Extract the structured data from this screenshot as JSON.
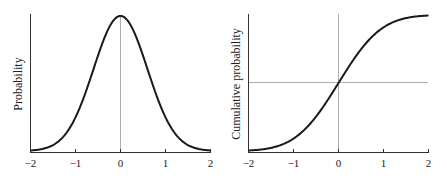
{
  "chart_data": [
    {
      "type": "line",
      "title": "",
      "xlabel": "",
      "ylabel": "Probability",
      "xlim": [
        -2,
        2
      ],
      "x_ticks": [
        "−2",
        "−1",
        "0",
        "1",
        "2"
      ],
      "y_ticks": [],
      "grid": false,
      "reference_lines": [
        {
          "orientation": "vertical",
          "x": 0
        }
      ],
      "series": [
        {
          "name": "Normal PDF",
          "function": "exp(-x^2/(2*0.6^2))",
          "x": [
            -2,
            -1.5,
            -1,
            -0.5,
            0,
            0.5,
            1,
            1.5,
            2
          ],
          "values": [
            0.004,
            0.044,
            0.25,
            0.7,
            1.0,
            0.7,
            0.25,
            0.044,
            0.004
          ]
        }
      ]
    },
    {
      "type": "line",
      "title": "",
      "xlabel": "",
      "ylabel": "Cumulative probability",
      "xlim": [
        -2,
        2
      ],
      "x_ticks": [
        "−2",
        "−1",
        "0",
        "1",
        "2"
      ],
      "y_ticks": [],
      "grid": false,
      "reference_lines": [
        {
          "orientation": "vertical",
          "x": 0
        },
        {
          "orientation": "horizontal",
          "y": 0.5
        }
      ],
      "series": [
        {
          "name": "Normal CDF",
          "x": [
            -2,
            -1.5,
            -1,
            -0.5,
            0,
            0.5,
            1,
            1.5,
            2
          ],
          "values": [
            0.0,
            0.02,
            0.1,
            0.27,
            0.5,
            0.73,
            0.9,
            0.98,
            1.0
          ]
        }
      ]
    }
  ],
  "left": {
    "ylabel": "Probability",
    "ticks": [
      "−2",
      "−1",
      "0",
      "1",
      "2"
    ]
  },
  "right": {
    "ylabel": "Cumulative probability",
    "ticks": [
      "−2",
      "−1",
      "0",
      "1",
      "2"
    ]
  }
}
